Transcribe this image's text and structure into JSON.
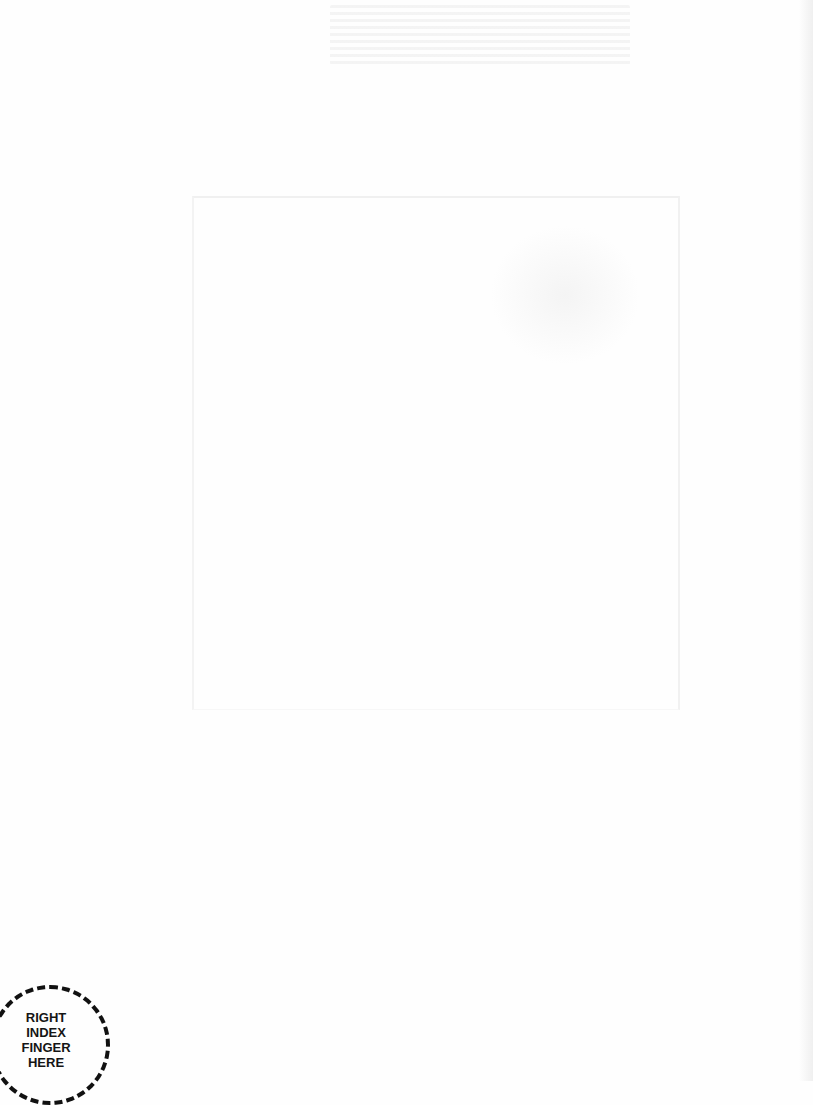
{
  "document": {
    "type": "scanned-page",
    "background_color": "#fefefe",
    "print_box": {
      "label": "",
      "border_color": "#f0f0f0"
    },
    "finger_marker": {
      "label": "RIGHT\nINDEX\nFINGER\nHERE",
      "lines": [
        "RIGHT",
        "INDEX",
        "FINGER",
        "HERE"
      ],
      "border_style": "dashed",
      "color": "#111111"
    }
  }
}
